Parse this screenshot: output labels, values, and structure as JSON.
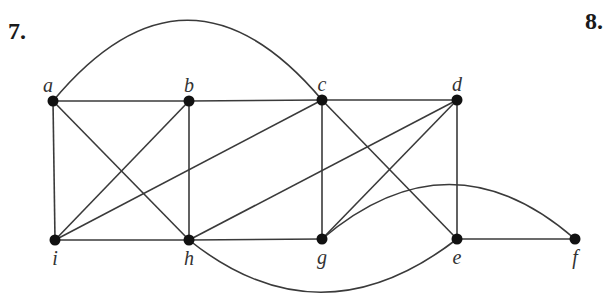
{
  "problems": [
    {
      "label": "7.",
      "x": 8,
      "y": 18
    },
    {
      "label": "8.",
      "x": 585,
      "y": 8
    }
  ],
  "graph": {
    "nodes": [
      {
        "id": "a",
        "label": "a",
        "x": 53,
        "y": 101,
        "lx": 48,
        "ly": 92,
        "anchor": "middle"
      },
      {
        "id": "b",
        "label": "b",
        "x": 189,
        "y": 101,
        "lx": 189,
        "ly": 92,
        "anchor": "middle"
      },
      {
        "id": "c",
        "label": "c",
        "x": 322,
        "y": 100,
        "lx": 322,
        "ly": 91,
        "anchor": "middle"
      },
      {
        "id": "d",
        "label": "d",
        "x": 457,
        "y": 100,
        "lx": 457,
        "ly": 91,
        "anchor": "middle"
      },
      {
        "id": "i",
        "label": "i",
        "x": 55,
        "y": 240,
        "lx": 55,
        "ly": 265,
        "anchor": "middle"
      },
      {
        "id": "h",
        "label": "h",
        "x": 189,
        "y": 240,
        "lx": 189,
        "ly": 265,
        "anchor": "middle"
      },
      {
        "id": "g",
        "label": "g",
        "x": 322,
        "y": 239,
        "lx": 322,
        "ly": 264,
        "anchor": "middle"
      },
      {
        "id": "e",
        "label": "e",
        "x": 457,
        "y": 239,
        "lx": 457,
        "ly": 264,
        "anchor": "middle"
      },
      {
        "id": "f",
        "label": "f",
        "x": 575,
        "y": 239,
        "lx": 575,
        "ly": 264,
        "anchor": "middle"
      }
    ],
    "edges": [
      {
        "from": "a",
        "to": "b"
      },
      {
        "from": "b",
        "to": "c"
      },
      {
        "from": "c",
        "to": "d"
      },
      {
        "from": "a",
        "to": "i"
      },
      {
        "from": "a",
        "to": "h"
      },
      {
        "from": "b",
        "to": "i"
      },
      {
        "from": "b",
        "to": "h"
      },
      {
        "from": "c",
        "to": "i"
      },
      {
        "from": "c",
        "to": "g"
      },
      {
        "from": "c",
        "to": "e"
      },
      {
        "from": "d",
        "to": "h"
      },
      {
        "from": "d",
        "to": "g"
      },
      {
        "from": "d",
        "to": "e"
      },
      {
        "from": "i",
        "to": "h"
      },
      {
        "from": "h",
        "to": "g"
      },
      {
        "from": "e",
        "to": "f"
      },
      {
        "from": "a",
        "to": "c",
        "curve": "M 53 101 Q 187 -60 322 100"
      },
      {
        "from": "g",
        "to": "f",
        "curve": "M 322 239 Q 450 130 575 239"
      },
      {
        "from": "h",
        "to": "e",
        "curve": "M 189 240 Q 320 345 457 239"
      }
    ]
  }
}
